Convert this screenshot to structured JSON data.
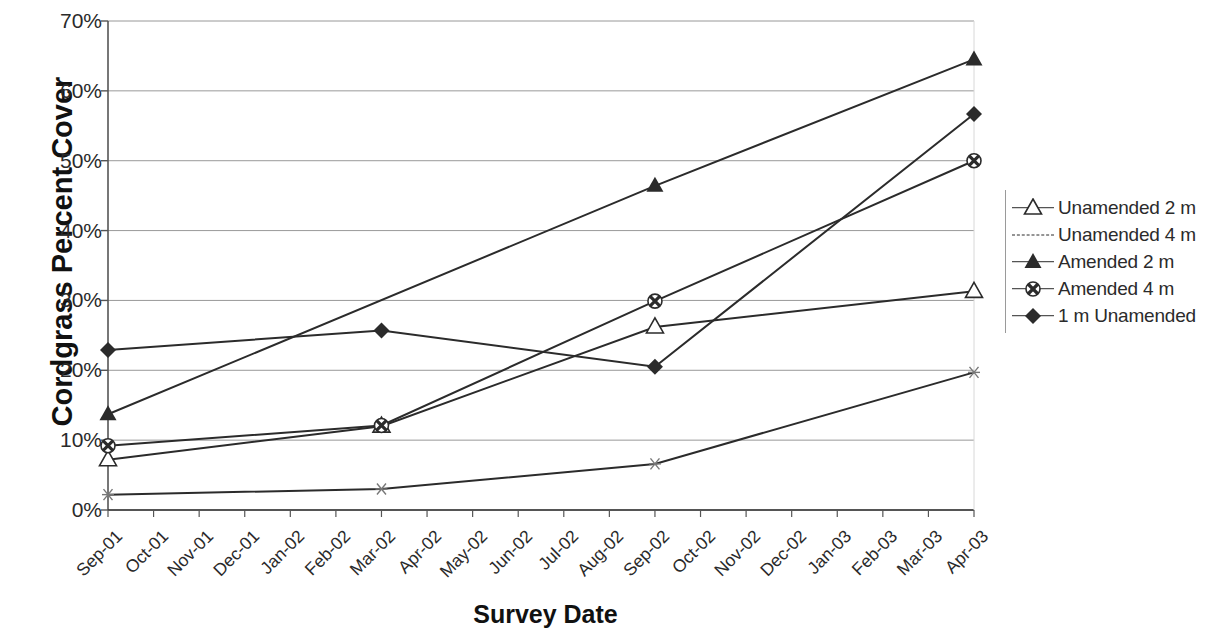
{
  "chart_data": {
    "type": "line",
    "title": "",
    "xlabel": "Survey Date",
    "ylabel": "Cordgrass Percent Cover",
    "ylim": [
      0,
      70
    ],
    "ytick_labels": [
      "0%",
      "10%",
      "20%",
      "30%",
      "40%",
      "50%",
      "60%",
      "70%"
    ],
    "ytick_values": [
      0,
      10,
      20,
      30,
      40,
      50,
      60,
      70
    ],
    "grid": true,
    "legend_position": "right",
    "categories": [
      "Sep-01",
      "Oct-01",
      "Nov-01",
      "Dec-01",
      "Jan-02",
      "Feb-02",
      "Mar-02",
      "Apr-02",
      "May-02",
      "Jun-02",
      "Jul-02",
      "Aug-02",
      "Sep-02",
      "Oct-02",
      "Nov-02",
      "Dec-02",
      "Jan-03",
      "Feb-03",
      "Mar-03",
      "Apr-03"
    ],
    "series": [
      {
        "name": "Unamended 2 m",
        "marker": "open-triangle",
        "line": "solid",
        "color": "#2b2b2b",
        "x": [
          "Sep-01",
          "Mar-02",
          "Sep-02",
          "Apr-03"
        ],
        "values": [
          7.2,
          12.0,
          26.2,
          31.3
        ]
      },
      {
        "name": "Unamended 4 m",
        "marker": "star",
        "line": "dashed",
        "color": "#2b2b2b",
        "x": [
          "Sep-01",
          "Mar-02",
          "Sep-02",
          "Apr-03"
        ],
        "values": [
          2.2,
          3.0,
          6.6,
          19.7
        ]
      },
      {
        "name": "Amended 2 m",
        "marker": "filled-triangle",
        "line": "solid",
        "color": "#2b2b2b",
        "x": [
          "Sep-01",
          "Sep-02",
          "Apr-03"
        ],
        "values": [
          13.7,
          46.4,
          64.5
        ]
      },
      {
        "name": "Amended 4 m",
        "marker": "circle-x",
        "line": "solid",
        "color": "#2b2b2b",
        "x": [
          "Sep-01",
          "Mar-02",
          "Sep-02",
          "Apr-03"
        ],
        "values": [
          9.2,
          12.1,
          29.9,
          50.0
        ]
      },
      {
        "name": "1 m Unamended",
        "marker": "filled-diamond",
        "line": "solid",
        "color": "#2b2b2b",
        "x": [
          "Sep-01",
          "Mar-02",
          "Sep-02",
          "Apr-03"
        ],
        "values": [
          22.9,
          25.7,
          20.5,
          56.7
        ]
      }
    ]
  }
}
